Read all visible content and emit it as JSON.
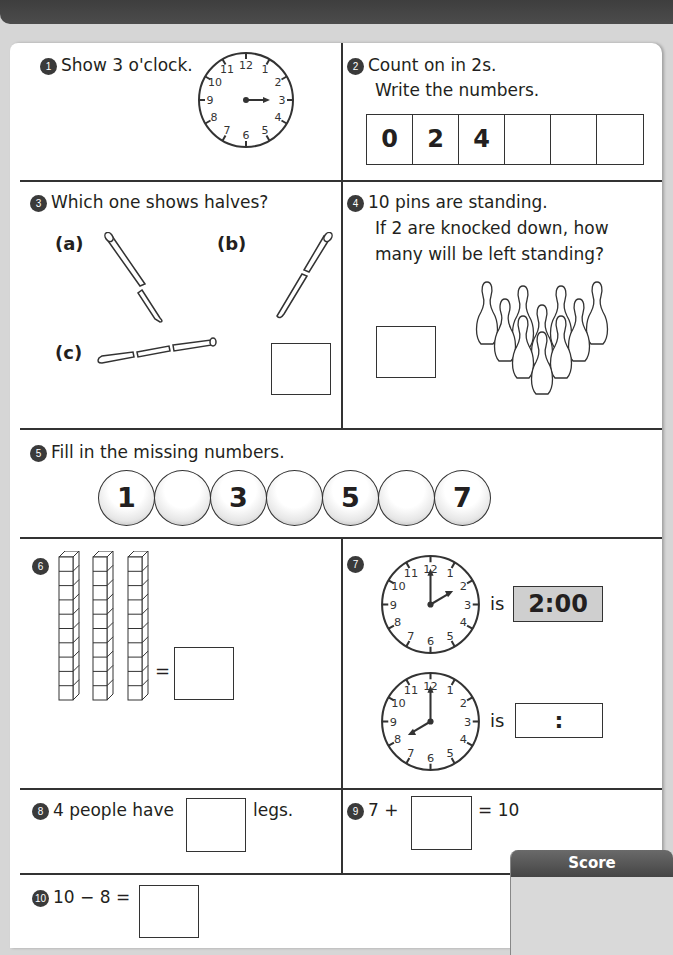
{
  "questions": {
    "q1": {
      "num": "1",
      "text": "Show 3 o'clock.",
      "clock": {
        "hour_hand": "3",
        "minute_hand": "none"
      }
    },
    "q2": {
      "num": "2",
      "line1": "Count on in 2s.",
      "line2": "Write the numbers.",
      "cells": [
        "0",
        "2",
        "4",
        "",
        "",
        ""
      ]
    },
    "q3": {
      "num": "3",
      "text": "Which one shows halves?",
      "options": [
        "(a)",
        "(b)",
        "(c)"
      ],
      "answer": ""
    },
    "q4": {
      "num": "4",
      "line1": "10 pins are standing.",
      "line2": "If 2 are knocked down, how",
      "line3": "many will be left standing?",
      "pin_count": 10,
      "answer": ""
    },
    "q5": {
      "num": "5",
      "text": "Fill in the missing numbers.",
      "beads": [
        "1",
        "",
        "3",
        "",
        "5",
        "",
        "7"
      ]
    },
    "q6": {
      "num": "6",
      "rods": 3,
      "cubes_per_rod": 10,
      "equals": "=",
      "answer": ""
    },
    "q7": {
      "num": "7",
      "clocks": [
        {
          "time_shown": "2 o'clock",
          "is_label": "is",
          "digital": "2:00"
        },
        {
          "time_shown": "8 o'clock",
          "is_label": "is",
          "digital": ":"
        }
      ]
    },
    "q8": {
      "num": "8",
      "text_before": "4 people have",
      "text_after": "legs.",
      "answer": ""
    },
    "q9": {
      "num": "9",
      "text_before": "7 +",
      "text_after": "= 10",
      "answer": ""
    },
    "q10": {
      "num": "10",
      "text_before": "10 − 8 =",
      "answer": ""
    }
  },
  "score": {
    "label": "Score",
    "value": ""
  },
  "clock_numbers": [
    "12",
    "1",
    "2",
    "3",
    "4",
    "5",
    "6",
    "7",
    "8",
    "9",
    "10",
    "11"
  ]
}
